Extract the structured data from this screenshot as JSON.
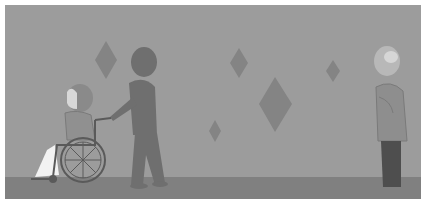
{
  "scene": {
    "description": "Grayscale illustration: a caregiver pushes a person in a wheelchair along a wall decorated with diamond shapes; an elderly man stands at the right watching.",
    "colors": {
      "wall": "#9c9c9c",
      "floor": "#808080",
      "diamond": "#848484",
      "caregiver": "#6f6f6f",
      "wheelchair_frame": "#5a5a5a",
      "elderly_jacket": "#8e8e8e",
      "elderly_pants": "#4e4e4e"
    },
    "figures": [
      {
        "id": "wheelchair-user",
        "label": "Person seated in wheelchair"
      },
      {
        "id": "caregiver",
        "label": "Caregiver pushing wheelchair"
      },
      {
        "id": "elderly-man",
        "label": "Elderly man standing"
      }
    ],
    "decorations": {
      "diamonds": [
        {
          "cx": 101,
          "cy": 55,
          "w": 22,
          "h": 38
        },
        {
          "cx": 234,
          "cy": 58,
          "w": 18,
          "h": 30
        },
        {
          "cx": 270,
          "cy": 99,
          "w": 33,
          "h": 55
        },
        {
          "cx": 210,
          "cy": 126,
          "w": 12,
          "h": 22
        },
        {
          "cx": 328,
          "cy": 66,
          "w": 14,
          "h": 22
        }
      ]
    }
  }
}
